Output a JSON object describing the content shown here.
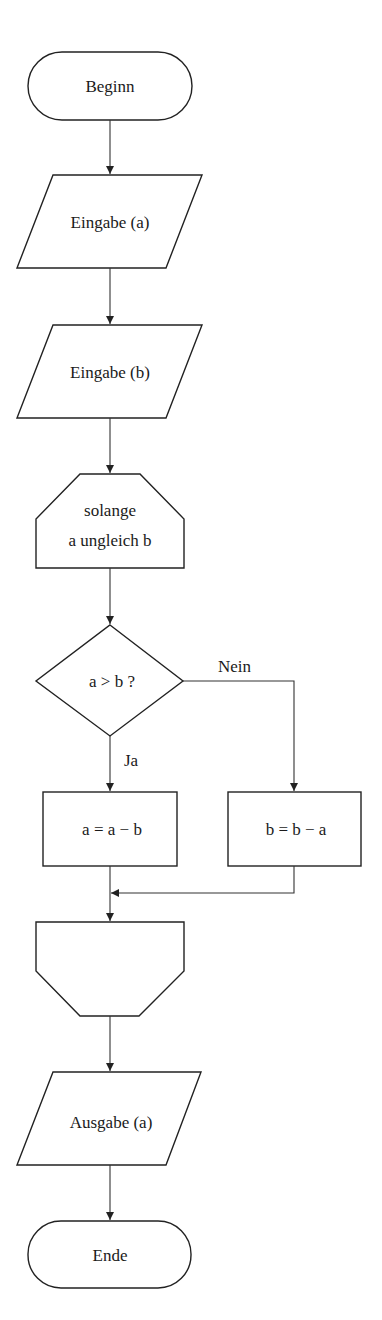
{
  "diagram": {
    "type": "flowchart",
    "nodes": {
      "start": {
        "shape": "terminator",
        "label": "Beginn"
      },
      "input_a": {
        "shape": "parallelogram",
        "label": "Eingabe (a)"
      },
      "input_b": {
        "shape": "parallelogram",
        "label": "Eingabe (b)"
      },
      "loop_start": {
        "shape": "loop-begin",
        "line1": "solange",
        "line2": "a ungleich b"
      },
      "decision": {
        "shape": "diamond",
        "label": "a > b ?"
      },
      "assign_a": {
        "shape": "rectangle",
        "label": "a = a − b"
      },
      "assign_b": {
        "shape": "rectangle",
        "label": "b = b − a"
      },
      "loop_end": {
        "shape": "loop-end",
        "label": ""
      },
      "output_a": {
        "shape": "parallelogram",
        "label": "Ausgabe (a)"
      },
      "end": {
        "shape": "terminator",
        "label": "Ende"
      }
    },
    "edges": {
      "yes_label": "Ja",
      "no_label": "Nein"
    },
    "colors": {
      "stroke": "#222222",
      "background": "#ffffff"
    }
  }
}
